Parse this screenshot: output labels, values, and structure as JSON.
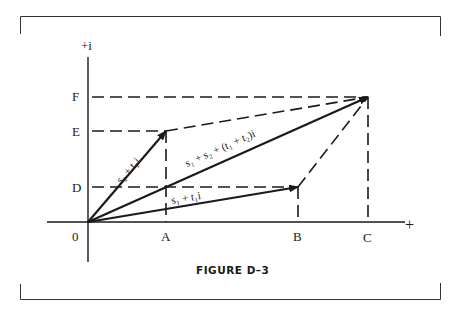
{
  "figure": {
    "caption": "FIGURE D–3",
    "axes": {
      "y_label": "+i",
      "x_label": "+",
      "origin_label": "0"
    },
    "x_ticks": [
      "A",
      "B",
      "C"
    ],
    "y_ticks": [
      "D",
      "E",
      "F"
    ],
    "vectors": [
      {
        "label": "s₂ + t₂i",
        "from": "0",
        "to": "(A, E)"
      },
      {
        "label": "s₁ + t₁i",
        "from": "0",
        "to": "(B, D)"
      },
      {
        "label": "s₁ + s₂ + (t₁ + t₂)i",
        "from": "0",
        "to": "(C, F)"
      }
    ],
    "colors": {
      "ink": "#1a1a1a",
      "background": "#ffffff"
    }
  }
}
